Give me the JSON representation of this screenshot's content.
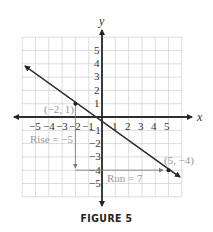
{
  "caption": "FIGURE 5",
  "axes": {
    "x_label": "x",
    "y_label": "y",
    "x_ticks": [
      "−5",
      "−4",
      "−3",
      "−2",
      "−1",
      "1",
      "2",
      "3",
      "4",
      "5"
    ],
    "y_ticks": [
      "5",
      "4",
      "3",
      "2",
      "1",
      "−1",
      "−2",
      "−3",
      "−4",
      "−5"
    ]
  },
  "points": [
    {
      "label": "(−2, 1)",
      "x": -2,
      "y": 1
    },
    {
      "label": "(5, −4)",
      "x": 5,
      "y": -4
    }
  ],
  "annotations": {
    "rise": "Rise = −5",
    "run": "Run = 7"
  },
  "colors": {
    "grid": "#cfcfcf",
    "axis": "#222222",
    "line": "#333333",
    "annotation": "#999999"
  },
  "chart_data": {
    "type": "line",
    "title": "FIGURE 5",
    "xlabel": "x",
    "ylabel": "y",
    "xlim": [
      -6,
      6
    ],
    "ylim": [
      -6,
      6
    ],
    "grid": true,
    "series": [
      {
        "name": "line through (−2, 1) and (5, −4)",
        "x": [
          -2,
          5
        ],
        "y": [
          1,
          -4
        ],
        "slope": -0.7142857
      }
    ],
    "annotations": [
      {
        "text": "(−2, 1)",
        "x": -2,
        "y": 1
      },
      {
        "text": "(5, −4)",
        "x": 5,
        "y": -4
      },
      {
        "text": "Rise = −5",
        "from": [
          -2,
          1
        ],
        "to": [
          -2,
          -4
        ]
      },
      {
        "text": "Run = 7",
        "from": [
          -2,
          -4
        ],
        "to": [
          5,
          -4
        ]
      }
    ]
  }
}
